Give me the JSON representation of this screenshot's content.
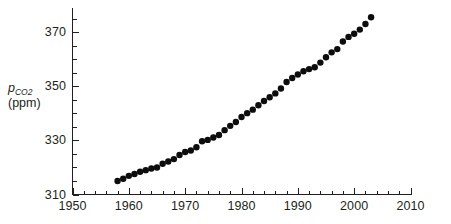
{
  "figure": {
    "background_color": "#ffffff",
    "ink_color": "#231f20",
    "marker_color": "#0d0d0d"
  },
  "axis_title": {
    "symbol": "p",
    "subscript": "CO",
    "subscript_number": "2",
    "units": "(ppm)"
  },
  "chart_data": {
    "type": "scatter",
    "title": "",
    "subtitle": "",
    "xlabel": "",
    "ylabel": "pCO2 (ppm)",
    "xlim": [
      1950,
      2010
    ],
    "ylim": [
      310,
      379
    ],
    "grid": false,
    "legend": null,
    "x_major_ticks": [
      1950,
      1960,
      1970,
      1980,
      1990,
      2000,
      2010
    ],
    "x_major_tick_labels": [
      "1950",
      "1960",
      "1970",
      "1980",
      "1990",
      "2000",
      "2010"
    ],
    "x_minor_tick_interval": 2,
    "y_major_ticks": [
      310,
      330,
      350,
      370
    ],
    "y_major_tick_labels": [
      "310",
      "330",
      "350",
      "370"
    ],
    "y_minor_tick_interval": 5,
    "marker": "filled-circle",
    "marker_size_px": 6.4,
    "series": [
      {
        "name": "Atmospheric CO2 annual mean",
        "x": [
          1958,
          1959,
          1960,
          1961,
          1962,
          1963,
          1964,
          1965,
          1966,
          1967,
          1968,
          1969,
          1970,
          1971,
          1972,
          1973,
          1974,
          1975,
          1976,
          1977,
          1978,
          1979,
          1980,
          1981,
          1982,
          1983,
          1984,
          1985,
          1986,
          1987,
          1988,
          1989,
          1990,
          1991,
          1992,
          1993,
          1994,
          1995,
          1996,
          1997,
          1998,
          1999,
          2000,
          2001,
          2002,
          2003
        ],
        "values": [
          315.0,
          315.8,
          316.9,
          317.6,
          318.4,
          319.0,
          319.6,
          320.0,
          321.4,
          322.2,
          323.1,
          324.6,
          325.7,
          326.3,
          327.5,
          329.7,
          330.2,
          331.1,
          332.0,
          333.8,
          335.4,
          336.8,
          338.7,
          340.1,
          341.4,
          343.0,
          344.6,
          346.0,
          347.4,
          349.2,
          351.6,
          353.1,
          354.4,
          355.6,
          356.4,
          357.1,
          358.8,
          360.8,
          362.6,
          363.8,
          366.6,
          368.3,
          369.5,
          371.0,
          373.1,
          375.6
        ]
      }
    ]
  }
}
